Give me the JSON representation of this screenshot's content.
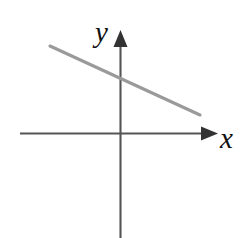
{
  "figure": {
    "kind": "coordinate-plane-line-graph",
    "width": 244,
    "height": 238,
    "background_color": "#ffffff",
    "axis_color": "#555555",
    "line_color": "#9a9a9a",
    "label_color": "#111111",
    "labels": {
      "x_axis_label": "x",
      "y_axis_label": "y"
    }
  },
  "chart_data": {
    "type": "line",
    "title": "",
    "subtitle": "",
    "xlabel": "x",
    "ylabel": "y",
    "grid": false,
    "legend": false,
    "legend_position": "none",
    "axes": {
      "origin_px": [
        120,
        133
      ],
      "x_axis": {
        "start_px": [
          20,
          133
        ],
        "end_px": [
          218,
          133
        ],
        "arrow": "right",
        "label": "x",
        "tick_labels": []
      },
      "y_axis": {
        "start_px": [
          120,
          238
        ],
        "end_px": [
          120,
          30
        ],
        "arrow": "up",
        "label": "y",
        "tick_labels": []
      }
    },
    "series": [
      {
        "name": "line",
        "color": "#9a9a9a",
        "slope_sign": "negative",
        "slope": -0.46,
        "y_intercept_px": 78,
        "points_px": [
          [
            50,
            46
          ],
          [
            200,
            115
          ]
        ],
        "x": [
          -70,
          80
        ],
        "values": [
          87,
          -18
        ]
      }
    ],
    "annotations": []
  }
}
